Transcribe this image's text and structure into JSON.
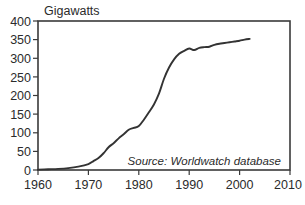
{
  "chart_data": {
    "type": "line",
    "title": "",
    "subtitle": "",
    "xlabel": "",
    "ylabel": "Gigawatts",
    "xlim": [
      1960,
      2010
    ],
    "ylim": [
      0,
      400
    ],
    "grid": false,
    "legend": "none",
    "annotations": [
      {
        "name": "source-note",
        "text": "Source: Worldwatch database",
        "x": 1998,
        "y": 42,
        "style": "italic"
      }
    ],
    "xticks": [
      1960,
      1970,
      1980,
      1990,
      2000,
      2010
    ],
    "xtick_labels": [
      "1960",
      "1970",
      "1980",
      "1990",
      "2000",
      "2010"
    ],
    "yticks": [
      0,
      50,
      100,
      150,
      200,
      250,
      300,
      350,
      400
    ],
    "ytick_labels": [
      "0",
      "50",
      "100",
      "150",
      "200",
      "250",
      "300",
      "350",
      "400"
    ],
    "series": [
      {
        "name": "Installed nuclear capacity",
        "color": "#333333",
        "x": [
          1960,
          1962,
          1964,
          1966,
          1968,
          1970,
          1971,
          1972,
          1973,
          1974,
          1975,
          1976,
          1977,
          1978,
          1979,
          1980,
          1981,
          1982,
          1983,
          1984,
          1985,
          1986,
          1987,
          1988,
          1989,
          1990,
          1991,
          1992,
          1993,
          1994,
          1995,
          1996,
          1997,
          1998,
          1999,
          2000,
          2001,
          2002
        ],
        "y": [
          1,
          2,
          3,
          5,
          9,
          16,
          24,
          32,
          45,
          61,
          72,
          85,
          96,
          108,
          113,
          118,
          135,
          155,
          176,
          205,
          245,
          275,
          297,
          312,
          320,
          326,
          322,
          328,
          330,
          331,
          336,
          339,
          341,
          343,
          345,
          347,
          350,
          352
        ]
      }
    ]
  },
  "axes": {
    "ylabel_position": "top-left",
    "frame": "box"
  }
}
